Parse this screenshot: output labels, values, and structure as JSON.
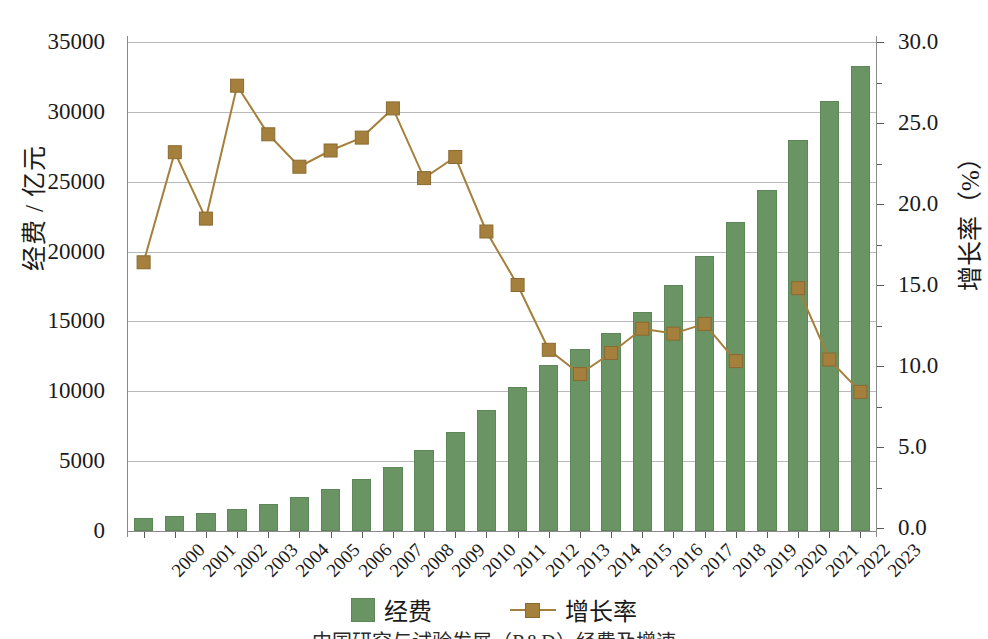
{
  "chart_data": {
    "type": "bar",
    "title": "",
    "subtitle": "",
    "caption": "中国研究与试验发展（R&D）经费及增速",
    "xlabel": "",
    "ylabel": "经费 / 亿元",
    "ylabel_right": "增长率（%）",
    "grid": true,
    "legend_position": "bottom",
    "ylim": [
      0,
      35000
    ],
    "ylim_right": [
      0.0,
      30.0
    ],
    "yticks": [
      "0",
      "5000",
      "10000",
      "15000",
      "20000",
      "25000",
      "30000",
      "35000"
    ],
    "ytick_values": [
      0,
      5000,
      10000,
      15000,
      20000,
      25000,
      30000,
      35000
    ],
    "yticks_right": [
      "0.0",
      "5.0",
      "10.0",
      "15.0",
      "20.0",
      "25.0",
      "30.0"
    ],
    "ytick_values_right": [
      0.0,
      5.0,
      10.0,
      15.0,
      20.0,
      25.0,
      30.0
    ],
    "categories": [
      "2000",
      "2001",
      "2002",
      "2003",
      "2004",
      "2005",
      "2006",
      "2007",
      "2008",
      "2009",
      "2010",
      "2011",
      "2012",
      "2013",
      "2014",
      "2015",
      "2016",
      "2017",
      "2018",
      "2019",
      "2020",
      "2021",
      "2022",
      "2023"
    ],
    "series": [
      {
        "name": "经费",
        "type": "bar",
        "axis": "left",
        "unit": "亿元",
        "color": "#6b9464",
        "values": [
          895,
          1043,
          1288,
          1540,
          1966,
          2450,
          3003,
          3710,
          4616,
          5802,
          7063,
          8687,
          10298,
          11846,
          13016,
          14170,
          15677,
          17606,
          19678,
          22144,
          24393,
          27956,
          30782,
          33278
        ]
      },
      {
        "name": "增长率",
        "type": "line",
        "axis": "right",
        "unit": "%",
        "color": "#a5803c",
        "values": [
          16.4,
          23.2,
          19.1,
          27.3,
          24.3,
          22.3,
          23.3,
          24.1,
          25.9,
          21.6,
          22.9,
          18.3,
          15.0,
          11.0,
          9.5,
          10.8,
          12.3,
          12.0,
          12.6,
          10.3,
          null,
          14.8,
          10.4,
          8.4
        ]
      }
    ]
  },
  "legend": {
    "items": [
      {
        "label": "经费",
        "marker": "bar-swatch-icon"
      },
      {
        "label": "增长率",
        "marker": "line-marker-icon"
      }
    ]
  }
}
